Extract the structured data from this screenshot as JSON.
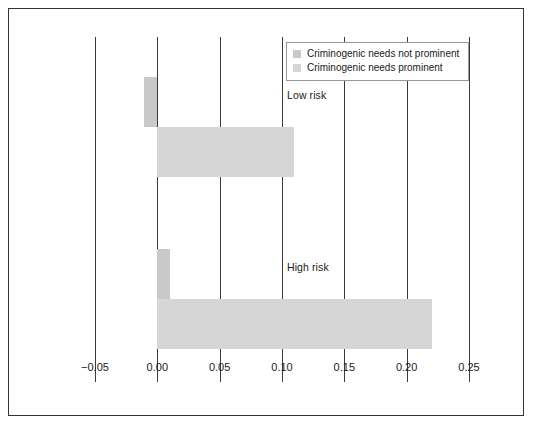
{
  "chart_data": {
    "type": "bar",
    "orientation": "horizontal",
    "title": "",
    "xlabel": "",
    "ylabel": "",
    "categories": [
      "Low risk",
      "High risk"
    ],
    "series": [
      {
        "name": "Criminogenic needs not prominent",
        "color": "#c9c9c9",
        "values": [
          -0.011,
          0.01
        ]
      },
      {
        "name": "Criminogenic needs prominent",
        "color": "#d6d6d6",
        "values": [
          0.11,
          0.22
        ]
      }
    ],
    "xlim": [
      -0.05,
      0.25
    ],
    "xticks": [
      "−0.05",
      "0.00",
      "0.05",
      "0.10",
      "0.15",
      "0.20",
      "0.25"
    ],
    "xtick_values": [
      -0.05,
      0.0,
      0.05,
      0.1,
      0.15,
      0.2,
      0.25
    ],
    "grid": true,
    "legend_position": "top-right"
  },
  "legend": {
    "items": [
      {
        "label": "Criminogenic needs not prominent",
        "color": "#c9c9c9"
      },
      {
        "label": "Criminogenic needs prominent",
        "color": "#d6d6d6"
      }
    ]
  },
  "axis": {
    "ticks": [
      {
        "label": "−0.05",
        "value": -0.05
      },
      {
        "label": "0.00",
        "value": 0.0
      },
      {
        "label": "0.05",
        "value": 0.05
      },
      {
        "label": "0.10",
        "value": 0.1
      },
      {
        "label": "0.15",
        "value": 0.15
      },
      {
        "label": "0.20",
        "value": 0.2
      },
      {
        "label": "0.25",
        "value": 0.25
      }
    ]
  },
  "groups": [
    {
      "label": "Low risk"
    },
    {
      "label": "High risk"
    }
  ]
}
